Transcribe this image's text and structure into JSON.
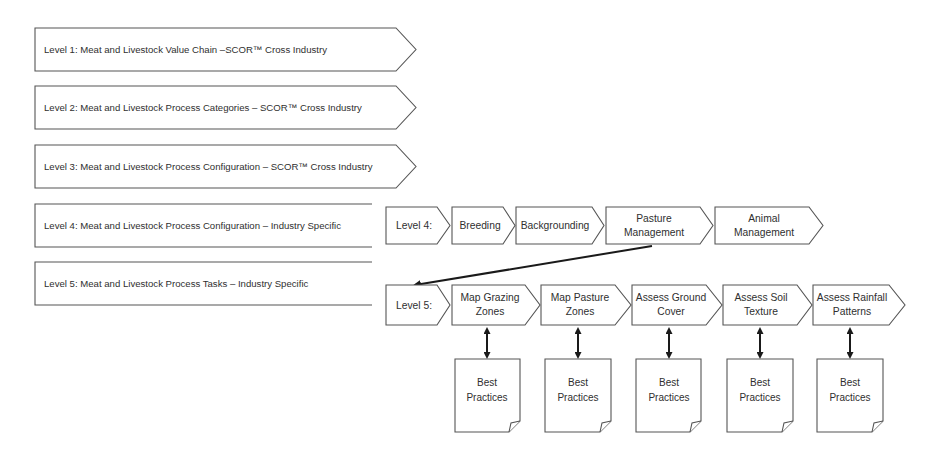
{
  "levels": [
    {
      "label": "Level 1: Meat and Livestock Value Chain –SCOR™ Cross Industry"
    },
    {
      "label": "Level 2: Meat and Livestock Process Categories – SCOR™ Cross Industry"
    },
    {
      "label": "Level 3: Meat and Livestock Process Configuration – SCOR™ Cross Industry"
    },
    {
      "label": "Level 4: Meat and Livestock Process Configuration – Industry Specific"
    },
    {
      "label": "Level 5: Meat and Livestock Process Tasks – Industry Specific"
    }
  ],
  "level4_row": {
    "header": "Level 4:",
    "steps": [
      {
        "line1": "Breeding",
        "line2": ""
      },
      {
        "line1": "Backgrounding",
        "line2": ""
      },
      {
        "line1": "Pasture",
        "line2": "Management"
      },
      {
        "line1": "Animal",
        "line2": "Management"
      }
    ]
  },
  "level5_row": {
    "header": "Level 5:",
    "steps": [
      {
        "line1": "Map Grazing",
        "line2": "Zones"
      },
      {
        "line1": "Map Pasture",
        "line2": "Zones"
      },
      {
        "line1": "Assess Ground",
        "line2": "Cover"
      },
      {
        "line1": "Assess Soil",
        "line2": "Texture"
      },
      {
        "line1": "Assess Rainfall",
        "line2": "Patterns"
      }
    ]
  },
  "documents": [
    {
      "line1": "Best",
      "line2": "Practices"
    },
    {
      "line1": "Best",
      "line2": "Practices"
    },
    {
      "line1": "Best",
      "line2": "Practices"
    },
    {
      "line1": "Best",
      "line2": "Practices"
    },
    {
      "line1": "Best",
      "line2": "Practices"
    }
  ],
  "colors": {
    "stroke": "#555555",
    "connector": "#1a1a1a",
    "text": "#2f2f2f",
    "background": "#ffffff"
  }
}
